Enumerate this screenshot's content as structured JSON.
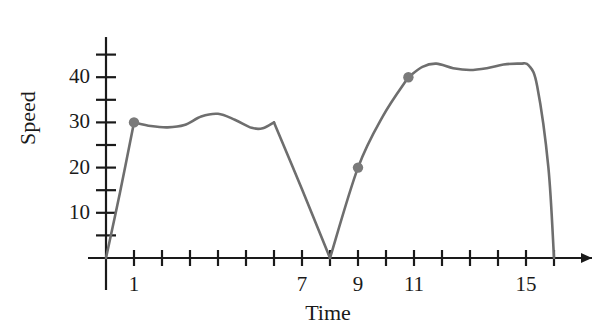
{
  "chart_data": {
    "type": "line",
    "title": "",
    "xlabel": "Time",
    "ylabel": "Speed",
    "xlim": [
      0,
      17
    ],
    "ylim": [
      0,
      48
    ],
    "grid": false,
    "legend": null,
    "line_color": "#6e6e6e",
    "axis_color": "#1a1a1a",
    "marker_color": "#7a7a7a",
    "x_ticks": [
      0,
      1,
      2,
      3,
      4,
      5,
      6,
      7,
      8,
      9,
      10,
      11,
      12,
      13,
      14,
      15,
      16
    ],
    "x_tick_labels": [
      {
        "value": 1,
        "label": "1"
      },
      {
        "value": 7,
        "label": "7"
      },
      {
        "value": 9,
        "label": "9"
      },
      {
        "value": 11,
        "label": "11"
      },
      {
        "value": 15,
        "label": "15"
      }
    ],
    "y_ticks": [
      5,
      10,
      15,
      20,
      25,
      30,
      35,
      40,
      45
    ],
    "y_tick_labels": [
      {
        "value": 10,
        "label": "10"
      },
      {
        "value": 20,
        "label": "20"
      },
      {
        "value": 30,
        "label": "30"
      },
      {
        "value": 40,
        "label": "40"
      }
    ],
    "x": [
      0,
      0.5,
      1,
      1.6,
      2.2,
      2.8,
      3.4,
      4.0,
      4.6,
      5.2,
      5.6,
      6.0,
      7.0,
      8.0,
      9.0,
      9.9,
      10.8,
      11.3,
      11.8,
      12.4,
      13.0,
      13.6,
      14.2,
      14.8,
      15.1,
      15.4,
      15.8,
      16.0
    ],
    "values": [
      0,
      14.5,
      30,
      29.2,
      28.9,
      29.4,
      31.3,
      31.9,
      30.6,
      28.8,
      28.7,
      30.0,
      15.2,
      0,
      20,
      31.5,
      40,
      42.3,
      43.0,
      42.0,
      41.6,
      42.0,
      42.8,
      43.0,
      42.6,
      38.0,
      20.0,
      0
    ],
    "highlighted_points": [
      {
        "x": 1,
        "y": 30
      },
      {
        "x": 9,
        "y": 20
      },
      {
        "x": 10.8,
        "y": 40
      }
    ]
  },
  "axes": {
    "x_axis_name": "Time",
    "y_axis_name": "Speed"
  }
}
